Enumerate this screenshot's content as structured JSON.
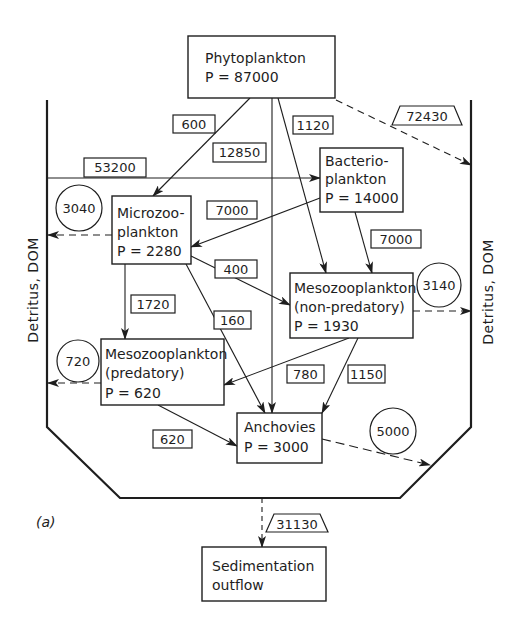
{
  "diagram": {
    "panel_label": "(a)",
    "colors": {
      "stroke": "#1e1e1e",
      "background": "#ffffff"
    },
    "side_labels": {
      "left": "Detritus, DOM",
      "right": "Detritus, DOM"
    },
    "nodes": {
      "phytoplankton": {
        "name": "Phytoplankton",
        "production": "P = 87000"
      },
      "bacterioplankton": {
        "name_line1": "Bacterio-",
        "name_line2": "plankton",
        "production": "P = 14000"
      },
      "microzooplankton": {
        "name_line1": "Microzoo-",
        "name_line2": "plankton",
        "production": "P = 2280"
      },
      "mesozoo_nonpred": {
        "name_line1": "Mesozooplankton",
        "name_line2": "(non-predatory)",
        "production": "P = 1930"
      },
      "mesozoo_pred": {
        "name_line1": "Mesozooplankton",
        "name_line2": "(predatory)",
        "production": "P = 620"
      },
      "anchovies": {
        "name": "Anchovies",
        "production": "P = 3000"
      },
      "sedimentation": {
        "name_line1": "Sedimentation",
        "name_line2": "outflow"
      }
    },
    "flows": [
      {
        "id": "phyto_to_micro",
        "from": "Phytoplankton",
        "to": "Microzooplankton",
        "value": "600",
        "style": "solid",
        "label_shape": "box"
      },
      {
        "id": "phyto_to_anchovies",
        "from": "Phytoplankton",
        "to": "Anchovies",
        "value": "12850",
        "style": "solid",
        "label_shape": "box"
      },
      {
        "id": "phyto_to_mesonp",
        "from": "Phytoplankton",
        "to": "Mesozooplankton (non-predatory)",
        "value": "1120",
        "style": "solid",
        "label_shape": "box"
      },
      {
        "id": "phyto_to_detritus",
        "from": "Phytoplankton",
        "to": "Detritus, DOM",
        "value": "72430",
        "style": "dashed",
        "label_shape": "trapezoid"
      },
      {
        "id": "detritus_to_bacterio",
        "from": "Detritus, DOM",
        "to": "Bacterioplankton",
        "value": "53200",
        "style": "solid",
        "label_shape": "box"
      },
      {
        "id": "bacterio_to_micro",
        "from": "Bacterioplankton",
        "to": "Microzooplankton",
        "value": "7000",
        "style": "solid",
        "label_shape": "box"
      },
      {
        "id": "bacterio_to_mesonp",
        "from": "Bacterioplankton",
        "to": "Mesozooplankton (non-predatory)",
        "value": "7000",
        "style": "solid",
        "label_shape": "box"
      },
      {
        "id": "micro_to_detritus",
        "from": "Microzooplankton",
        "to": "Detritus, DOM",
        "value": "3040",
        "style": "dashed",
        "label_shape": "circle"
      },
      {
        "id": "micro_to_mesonp",
        "from": "Microzooplankton",
        "to": "Mesozooplankton (non-predatory)",
        "value": "400",
        "style": "solid",
        "label_shape": "box"
      },
      {
        "id": "micro_to_mesop",
        "from": "Microzooplankton",
        "to": "Mesozooplankton (predatory)",
        "value": "1720",
        "style": "solid",
        "label_shape": "box"
      },
      {
        "id": "micro_to_anchovies",
        "from": "Microzooplankton",
        "to": "Anchovies",
        "value": "160",
        "style": "solid",
        "label_shape": "box"
      },
      {
        "id": "mesonp_to_detritus",
        "from": "Mesozooplankton (non-predatory)",
        "to": "Detritus, DOM",
        "value": "3140",
        "style": "dashed",
        "label_shape": "circle"
      },
      {
        "id": "mesonp_to_mesop",
        "from": "Mesozooplankton (non-predatory)",
        "to": "Mesozooplankton (predatory)",
        "value": "780",
        "style": "solid",
        "label_shape": "box"
      },
      {
        "id": "mesonp_to_anchovies",
        "from": "Mesozooplankton (non-predatory)",
        "to": "Anchovies",
        "value": "1150",
        "style": "solid",
        "label_shape": "box"
      },
      {
        "id": "mesop_to_detritus",
        "from": "Mesozooplankton (predatory)",
        "to": "Detritus, DOM",
        "value": "720",
        "style": "dashed",
        "label_shape": "circle"
      },
      {
        "id": "mesop_to_anchovies",
        "from": "Mesozooplankton (predatory)",
        "to": "Anchovies",
        "value": "620",
        "style": "solid",
        "label_shape": "box"
      },
      {
        "id": "anchovies_out",
        "from": "Anchovies",
        "to": "outside system",
        "value": "5000",
        "style": "dashed",
        "label_shape": "circle"
      },
      {
        "id": "sedimentation_out",
        "from": "System",
        "to": "Sedimentation outflow",
        "value": "31130",
        "style": "dashed",
        "label_shape": "trapezoid"
      }
    ]
  }
}
